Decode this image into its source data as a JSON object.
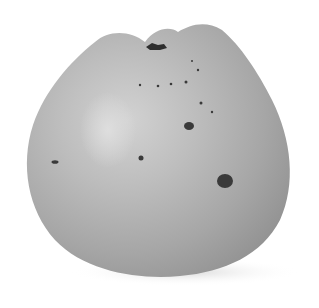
{
  "image": {
    "subject": "apple",
    "style": "grayscale botanical illustration",
    "colors": {
      "background": "#ffffff",
      "fruit_light": "#c4c4c4",
      "fruit_mid": "#a8a8a8",
      "fruit_dark": "#8a8a8a",
      "highlight": "#d4d4d4",
      "spots": "#3a3a3a",
      "shadow": "#e6e6e6"
    }
  }
}
